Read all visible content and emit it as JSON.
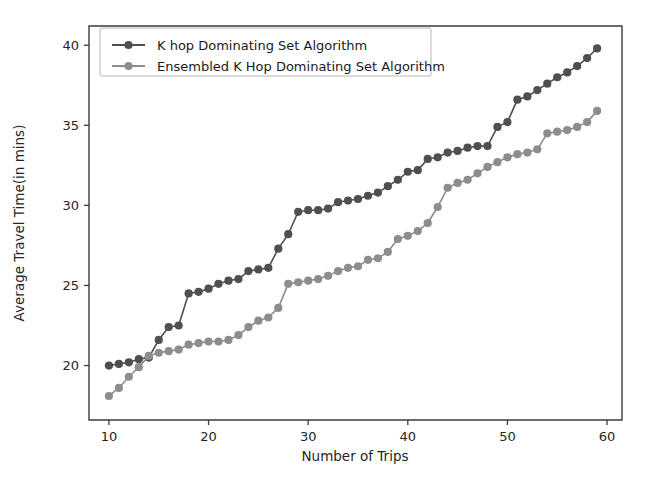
{
  "chart_data": {
    "type": "line",
    "title": "",
    "xlabel": "Number of Trips",
    "ylabel": "Average Travel Time(in mins)",
    "xlim": [
      8.0,
      61.5
    ],
    "ylim": [
      16.6,
      41.2
    ],
    "xticks": [
      10,
      20,
      30,
      40,
      50,
      60
    ],
    "xticklabels": [
      "10",
      "20",
      "30",
      "40",
      "50",
      "60"
    ],
    "yticks": [
      20,
      25,
      30,
      35,
      40
    ],
    "yticklabels": [
      "20",
      "25",
      "30",
      "35",
      "40"
    ],
    "grid": false,
    "legend_position": "upper left",
    "marker": "circle",
    "x": [
      10,
      11,
      12,
      13,
      14,
      15,
      16,
      17,
      18,
      19,
      20,
      21,
      22,
      23,
      24,
      25,
      26,
      27,
      28,
      29,
      30,
      31,
      32,
      33,
      34,
      35,
      36,
      37,
      38,
      39,
      40,
      41,
      42,
      43,
      44,
      45,
      46,
      47,
      48,
      49,
      50,
      51,
      52,
      53,
      54,
      55,
      56,
      57,
      58,
      59
    ],
    "series": [
      {
        "name": "K hop Dominating Set Algorithm",
        "color": "#4f4f4f",
        "values": [
          20.0,
          20.1,
          20.2,
          20.4,
          20.5,
          21.6,
          22.4,
          22.5,
          24.5,
          24.6,
          24.8,
          25.1,
          25.3,
          25.4,
          25.9,
          26.0,
          26.1,
          27.3,
          28.2,
          29.6,
          29.7,
          29.7,
          29.8,
          30.2,
          30.3,
          30.4,
          30.6,
          30.8,
          31.2,
          31.6,
          32.1,
          32.2,
          32.9,
          33.0,
          33.3,
          33.4,
          33.6,
          33.7,
          33.7,
          34.9,
          35.2,
          36.6,
          36.8,
          37.2,
          37.6,
          38.0,
          38.3,
          38.7,
          39.2,
          39.8
        ]
      },
      {
        "name": "Ensembled K Hop Dominating Set Algorithm",
        "color": "#8d8d8d",
        "values": [
          18.1,
          18.6,
          19.3,
          19.9,
          20.6,
          20.8,
          20.9,
          21.0,
          21.3,
          21.4,
          21.5,
          21.5,
          21.6,
          21.9,
          22.4,
          22.8,
          23.0,
          23.6,
          25.1,
          25.2,
          25.3,
          25.4,
          25.6,
          25.9,
          26.1,
          26.2,
          26.6,
          26.7,
          27.1,
          27.9,
          28.1,
          28.4,
          28.9,
          29.9,
          31.1,
          31.4,
          31.6,
          32.0,
          32.4,
          32.7,
          33.0,
          33.2,
          33.3,
          33.5,
          34.5,
          34.6,
          34.7,
          34.9,
          35.2,
          35.9
        ]
      }
    ]
  },
  "legend": {
    "entries": [
      {
        "label": "K hop Dominating Set Algorithm",
        "color": "#4f4f4f"
      },
      {
        "label": "Ensembled K Hop Dominating Set Algorithm",
        "color": "#8d8d8d"
      }
    ]
  },
  "axes": {
    "x_label": "Number of Trips",
    "y_label": "Average Travel Time(in mins)",
    "x_tick_labels": [
      "10",
      "20",
      "30",
      "40",
      "50",
      "60"
    ],
    "y_tick_labels": [
      "20",
      "25",
      "30",
      "35",
      "40"
    ]
  }
}
